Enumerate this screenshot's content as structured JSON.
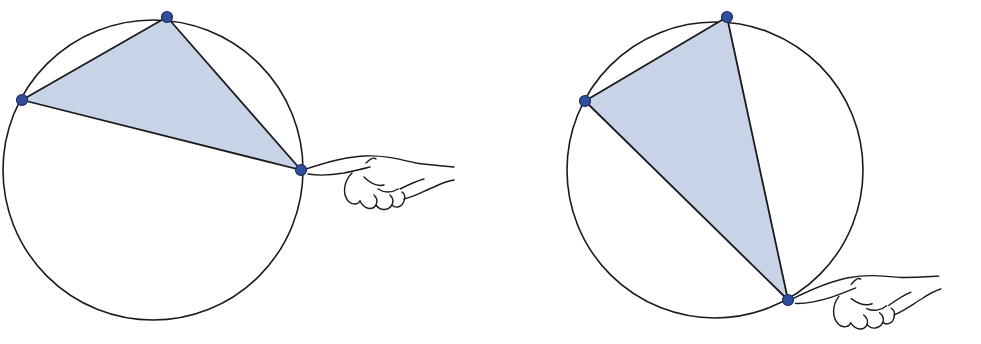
{
  "figure": {
    "description": "Two circles, each with an inscribed shaded triangle; a hand points at one vertex on the circle (the vertex being moved)",
    "colors": {
      "stroke": "#1a1a1a",
      "triangle_fill": "#c9d3e8",
      "vertex_fill": "#2f4f9a",
      "vertex_stroke": "#1b2d5e",
      "background": "#ffffff"
    },
    "panels": [
      {
        "name": "left",
        "circle": {
          "cx": 153,
          "cy": 170,
          "r": 150
        },
        "vertices": [
          {
            "x": 167,
            "y": 17
          },
          {
            "x": 22,
            "y": 100
          },
          {
            "x": 301,
            "y": 170
          }
        ],
        "pointer_vertex_index": 2,
        "hand": {
          "x": 301,
          "y": 170
        }
      },
      {
        "name": "right",
        "circle": {
          "cx": 715,
          "cy": 170,
          "r": 148
        },
        "vertices": [
          {
            "x": 727,
            "y": 17
          },
          {
            "x": 585,
            "y": 101
          },
          {
            "x": 788,
            "y": 300
          }
        ],
        "pointer_vertex_index": 2,
        "hand": {
          "x": 788,
          "y": 300
        }
      }
    ]
  }
}
